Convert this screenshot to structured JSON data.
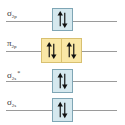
{
  "diagram": {
    "levels": [
      {
        "label": "σ",
        "sub": "2p",
        "sup": "",
        "electrons": 2,
        "boxes": 1,
        "color": "#d5e8ee"
      },
      {
        "label": "π",
        "sub": "2p",
        "sup": "",
        "electrons": 4,
        "boxes": 2,
        "color": "#f9e7a6"
      },
      {
        "label": "σ",
        "sub": "2s",
        "sup": "*",
        "electrons": 2,
        "boxes": 1,
        "color": "#d5e8ee"
      },
      {
        "label": "σ",
        "sub": "2s",
        "sup": "",
        "electrons": 2,
        "boxes": 1,
        "color": "#d5e8ee"
      }
    ]
  }
}
